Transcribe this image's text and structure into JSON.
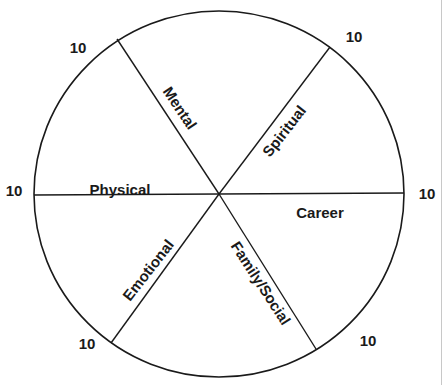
{
  "diagram": {
    "type": "wheel-of-life",
    "center": {
      "x": 219,
      "y": 194
    },
    "radius_x": 185,
    "radius_y": 183,
    "stroke_color": "#1a1a1a",
    "spokes": [
      {
        "name": "spoke-left",
        "x": 34,
        "y": 195
      },
      {
        "name": "spoke-right",
        "x": 404,
        "y": 193
      },
      {
        "name": "spoke-mental",
        "x": 117,
        "y": 39
      },
      {
        "name": "spoke-spiritual",
        "x": 330,
        "y": 47
      },
      {
        "name": "spoke-emotional",
        "x": 111,
        "y": 343
      },
      {
        "name": "spoke-family-social",
        "x": 316,
        "y": 349
      }
    ],
    "segments": [
      {
        "label": "Physical",
        "x": 120,
        "y": 189,
        "rotate": 0
      },
      {
        "label": "Mental",
        "x": 180,
        "y": 108,
        "rotate": 56
      },
      {
        "label": "Spiritual",
        "x": 284,
        "y": 131,
        "rotate": -52
      },
      {
        "label": "Career",
        "x": 320,
        "y": 212,
        "rotate": 0
      },
      {
        "label": "Family/Social",
        "x": 261,
        "y": 283,
        "rotate": 57
      },
      {
        "label": "Emotional",
        "x": 148,
        "y": 270,
        "rotate": -52
      }
    ],
    "scale_labels": [
      {
        "text": "10",
        "x": 78,
        "y": 53
      },
      {
        "text": "10",
        "x": 354,
        "y": 42
      },
      {
        "text": "10",
        "x": 14,
        "y": 196
      },
      {
        "text": "10",
        "x": 427,
        "y": 199
      },
      {
        "text": "10",
        "x": 87,
        "y": 349
      },
      {
        "text": "10",
        "x": 368,
        "y": 346
      }
    ]
  }
}
